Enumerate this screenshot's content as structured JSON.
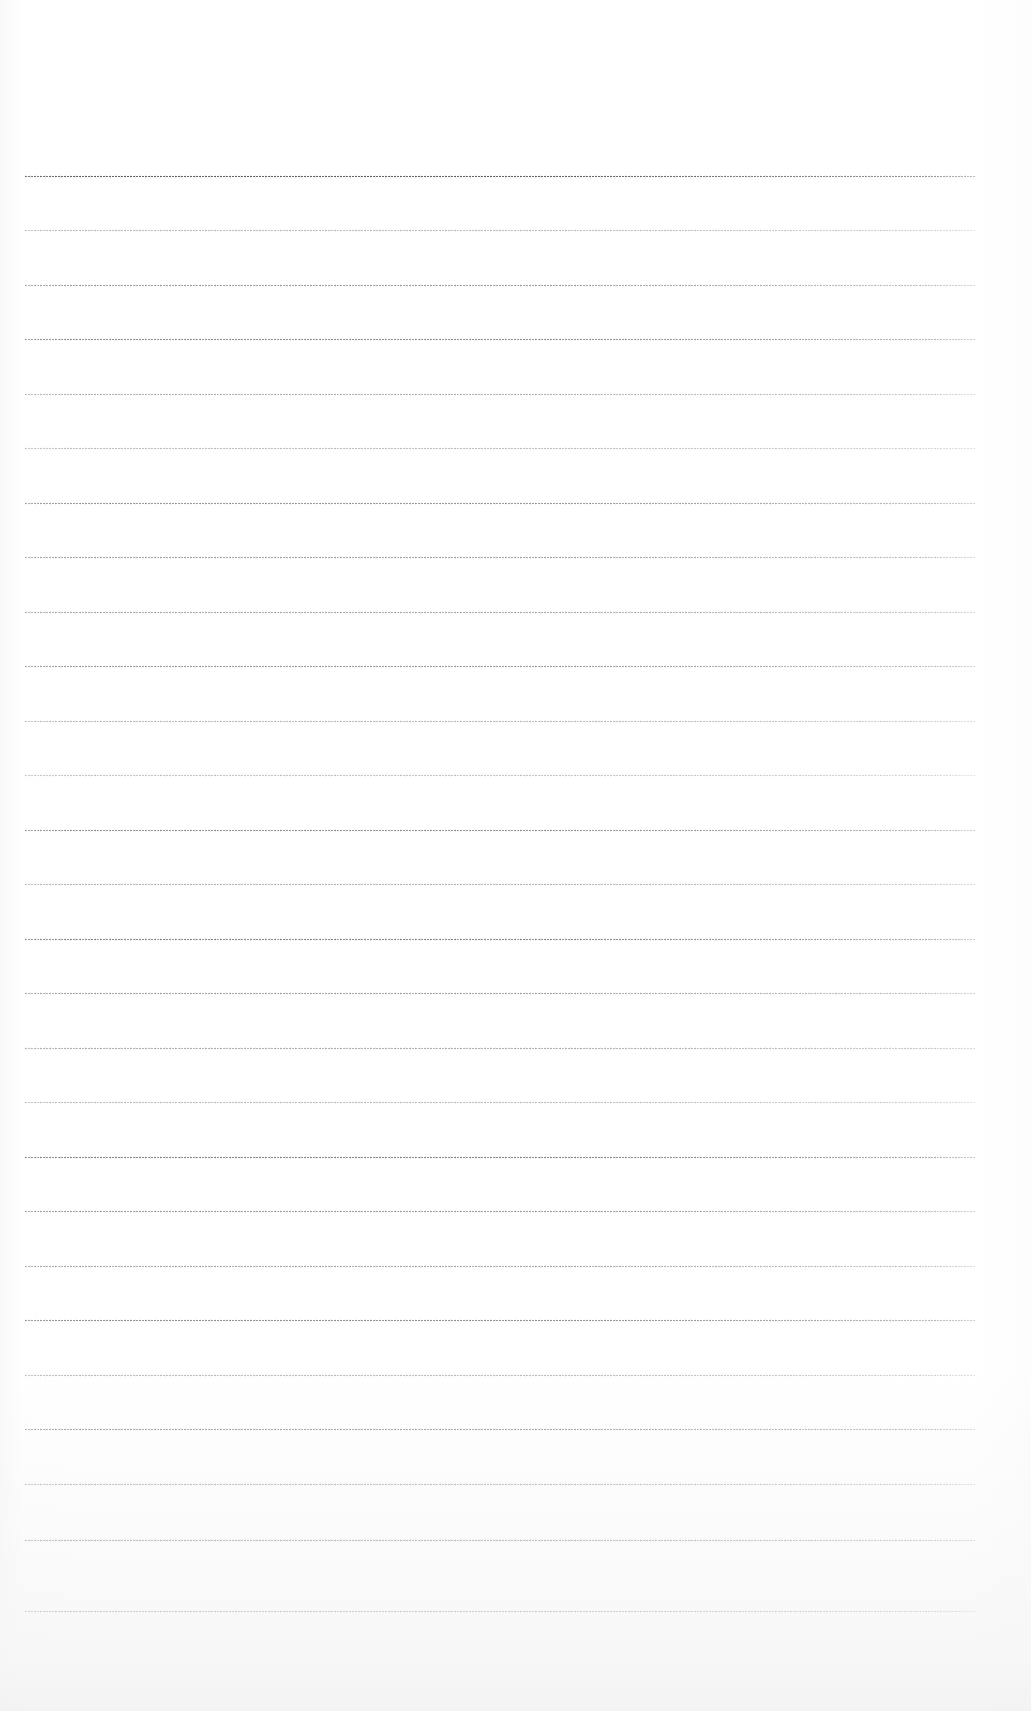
{
  "document": {
    "type": "scanned-blank-ruled-page",
    "title": "Scanned blank ruled notebook page",
    "page_width": 1031,
    "page_height": 1711,
    "background_color": "#ffffff",
    "visible_text": "",
    "has_text_content": false,
    "has_handwriting": false,
    "description": "A blank, lightly scanned sheet of ruled paper. No headings, body text, page numbers, captions, figures, tables, or annotations are present — only faint horizontal ruling lines."
  },
  "ruling": {
    "line_count": 27,
    "line_left_x": 25,
    "line_right_x": 975,
    "line_length": 950,
    "first_line_y": 176,
    "last_line_y": 1611,
    "line_spacing": 55,
    "line_color": "#6f7176",
    "line_color_faint": "#b7b9bd",
    "top_margin": 176,
    "bottom_margin": 100,
    "left_margin": 25,
    "right_margin": 56,
    "lines": [
      {
        "y": 176,
        "opacity": 0.92,
        "weight": "heavy",
        "color": "#54565b"
      },
      {
        "y": 230,
        "opacity": 0.5,
        "weight": "light",
        "color": "#7a7c81"
      },
      {
        "y": 285,
        "opacity": 0.62,
        "weight": "medium",
        "color": "#6e7075"
      },
      {
        "y": 339,
        "opacity": 0.7,
        "weight": "medium",
        "color": "#66686d"
      },
      {
        "y": 394,
        "opacity": 0.55,
        "weight": "light",
        "color": "#76787d"
      },
      {
        "y": 448,
        "opacity": 0.48,
        "weight": "light",
        "color": "#7e8085"
      },
      {
        "y": 503,
        "opacity": 0.66,
        "weight": "medium",
        "color": "#6a6c71"
      },
      {
        "y": 557,
        "opacity": 0.6,
        "weight": "medium",
        "color": "#707277"
      },
      {
        "y": 612,
        "opacity": 0.58,
        "weight": "medium",
        "color": "#727479"
      },
      {
        "y": 666,
        "opacity": 0.64,
        "weight": "medium",
        "color": "#6c6e73"
      },
      {
        "y": 721,
        "opacity": 0.52,
        "weight": "light",
        "color": "#7a7c81"
      },
      {
        "y": 775,
        "opacity": 0.46,
        "weight": "light",
        "color": "#82848a"
      },
      {
        "y": 830,
        "opacity": 0.68,
        "weight": "medium",
        "color": "#686a6f"
      },
      {
        "y": 884,
        "opacity": 0.54,
        "weight": "light",
        "color": "#76787d"
      },
      {
        "y": 939,
        "opacity": 0.72,
        "weight": "heavy",
        "color": "#62646a"
      },
      {
        "y": 993,
        "opacity": 0.6,
        "weight": "medium",
        "color": "#707277"
      },
      {
        "y": 1048,
        "opacity": 0.56,
        "weight": "medium",
        "color": "#74767b"
      },
      {
        "y": 1102,
        "opacity": 0.5,
        "weight": "light",
        "color": "#7c7e83"
      },
      {
        "y": 1157,
        "opacity": 0.74,
        "weight": "heavy",
        "color": "#5f6167"
      },
      {
        "y": 1211,
        "opacity": 0.64,
        "weight": "medium",
        "color": "#6c6e73"
      },
      {
        "y": 1266,
        "opacity": 0.58,
        "weight": "medium",
        "color": "#72747a"
      },
      {
        "y": 1320,
        "opacity": 0.7,
        "weight": "medium",
        "color": "#66686e"
      },
      {
        "y": 1375,
        "opacity": 0.5,
        "weight": "light",
        "color": "#7a7c82"
      },
      {
        "y": 1429,
        "opacity": 0.66,
        "weight": "medium",
        "color": "#6a6c72"
      },
      {
        "y": 1484,
        "opacity": 0.6,
        "weight": "medium",
        "color": "#6f7177"
      },
      {
        "y": 1540,
        "opacity": 0.76,
        "weight": "heavy",
        "color": "#5c5e64"
      },
      {
        "y": 1611,
        "opacity": 0.88,
        "weight": "heavy",
        "color": "#55575d"
      }
    ]
  }
}
